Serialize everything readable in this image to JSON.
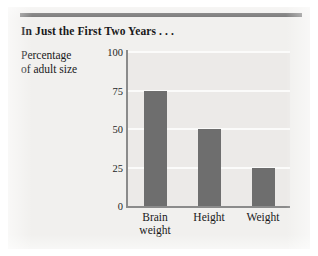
{
  "figure": {
    "title": "In Just the First Two Years . . .",
    "y_axis_caption_line1": "Percentage",
    "y_axis_caption_line2": "of adult size",
    "rule_color": "#6f6f6f",
    "panel_color": "#f1f0ee"
  },
  "chart_data": {
    "type": "bar",
    "title": "In Just the First Two Years . . .",
    "xlabel": "",
    "ylabel": "Percentage of adult size",
    "categories": [
      "Brain weight",
      "Height",
      "Weight"
    ],
    "category_lines": [
      [
        "Brain",
        "weight"
      ],
      [
        "Height"
      ],
      [
        "Weight"
      ]
    ],
    "values": [
      75,
      50,
      25
    ],
    "ylim": [
      0,
      100
    ],
    "yticks": [
      0,
      25,
      50,
      75,
      100
    ],
    "ytick_labels": [
      "0",
      "25",
      "50",
      "75",
      "100"
    ],
    "grid": true,
    "grid_axis": "y",
    "grid_color": "#fbfbfa",
    "legend": false,
    "bar_color": "#6e6e6e",
    "plot_background": "#eceae8",
    "axis_color": "#8b8b8b"
  }
}
